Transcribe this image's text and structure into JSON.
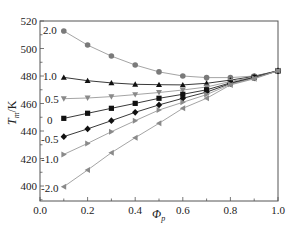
{
  "chart_data": {
    "type": "line",
    "title": "",
    "xlabel": "Φp",
    "xlabel_main": "Φ",
    "xlabel_sub": "p",
    "ylabel": "Tm/K",
    "ylabel_main": "T",
    "ylabel_sub": "m",
    "ylabel_unit": "/K",
    "xlim": [
      0.0,
      1.0
    ],
    "ylim": [
      389,
      520
    ],
    "xticks": [
      0.0,
      0.2,
      0.4,
      0.6,
      0.8,
      1.0
    ],
    "xtick_labels": [
      "0.0",
      "0.2",
      "0.4",
      "0.6",
      "0.8",
      "1.0"
    ],
    "yticks": [
      400,
      420,
      440,
      460,
      480,
      500,
      520
    ],
    "ytick_labels": [
      "400",
      "420",
      "440",
      "460",
      "480",
      "500",
      "520"
    ],
    "grid": false,
    "legend": "inline labels at left of each series",
    "x": [
      0.1,
      0.2,
      0.3,
      0.4,
      0.5,
      0.6,
      0.7,
      0.8,
      0.9,
      1.0
    ],
    "series": [
      {
        "name": "2.0",
        "label": "2.0",
        "marker": "circle",
        "color": "#7a7a7a",
        "line": "#9a9a9a",
        "values": [
          512.7,
          502.5,
          494.5,
          488.0,
          483.0,
          480.0,
          478.8,
          478.8,
          480.0,
          483.8
        ]
      },
      {
        "name": "1.0",
        "label": "1.0",
        "marker": "triangle-up",
        "color": "#111111",
        "line": "#222222",
        "values": [
          479.0,
          476.6,
          475.0,
          474.0,
          473.7,
          473.5,
          474.7,
          477.0,
          479.7,
          483.8
        ]
      },
      {
        "name": "0.5",
        "label": "0.5",
        "marker": "triangle-down",
        "color": "#8a8a8a",
        "line": "#9a9a9a",
        "values": [
          463.5,
          464.0,
          465.0,
          466.5,
          468.0,
          469.8,
          472.0,
          476.0,
          479.3,
          483.8
        ]
      },
      {
        "name": "0",
        "label": "0",
        "marker": "square",
        "color": "#111111",
        "line": "#222222",
        "values": [
          449.2,
          452.9,
          456.5,
          460.1,
          463.8,
          466.7,
          470.0,
          475.0,
          479.0,
          483.8
        ]
      },
      {
        "name": "-0.5",
        "label": "-0.5",
        "marker": "diamond",
        "color": "#111111",
        "line": "#222222",
        "values": [
          435.9,
          441.5,
          447.5,
          453.6,
          459.0,
          463.8,
          468.3,
          474.5,
          478.7,
          483.8
        ]
      },
      {
        "name": "-1.0",
        "label": "-1.0",
        "marker": "triangle-right",
        "color": "#8a8a8a",
        "line": "#9a9a9a",
        "values": [
          423.0,
          431.0,
          439.5,
          447.5,
          455.3,
          460.9,
          466.5,
          474.0,
          478.4,
          483.8
        ]
      },
      {
        "name": "-2.0",
        "label": "-2.0",
        "marker": "triangle-left",
        "color": "#8a8a8a",
        "line": "#9a9a9a",
        "values": [
          399.5,
          411.6,
          424.2,
          435.1,
          445.6,
          456.5,
          463.8,
          473.5,
          478.0,
          483.8
        ]
      }
    ]
  },
  "layout": {
    "plot": {
      "left": 40,
      "top": 21,
      "right": 278,
      "bottom": 201
    },
    "y_px_per_unit": 1.375,
    "y_ref_value": 520,
    "label_positions": [
      {
        "x": 43,
        "y": 34
      },
      {
        "x": 43,
        "y": 80
      },
      {
        "x": 45,
        "y": 103
      },
      {
        "x": 47,
        "y": 124
      },
      {
        "x": 41,
        "y": 143
      },
      {
        "x": 41,
        "y": 163
      },
      {
        "x": 41,
        "y": 192
      }
    ]
  }
}
